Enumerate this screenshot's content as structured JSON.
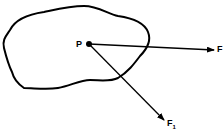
{
  "diagram": {
    "point_label": "P",
    "force_label": "F",
    "force1_label": "F",
    "force1_subscript": "1",
    "colors": {
      "stroke": "#000000",
      "background": "#ffffff"
    }
  }
}
